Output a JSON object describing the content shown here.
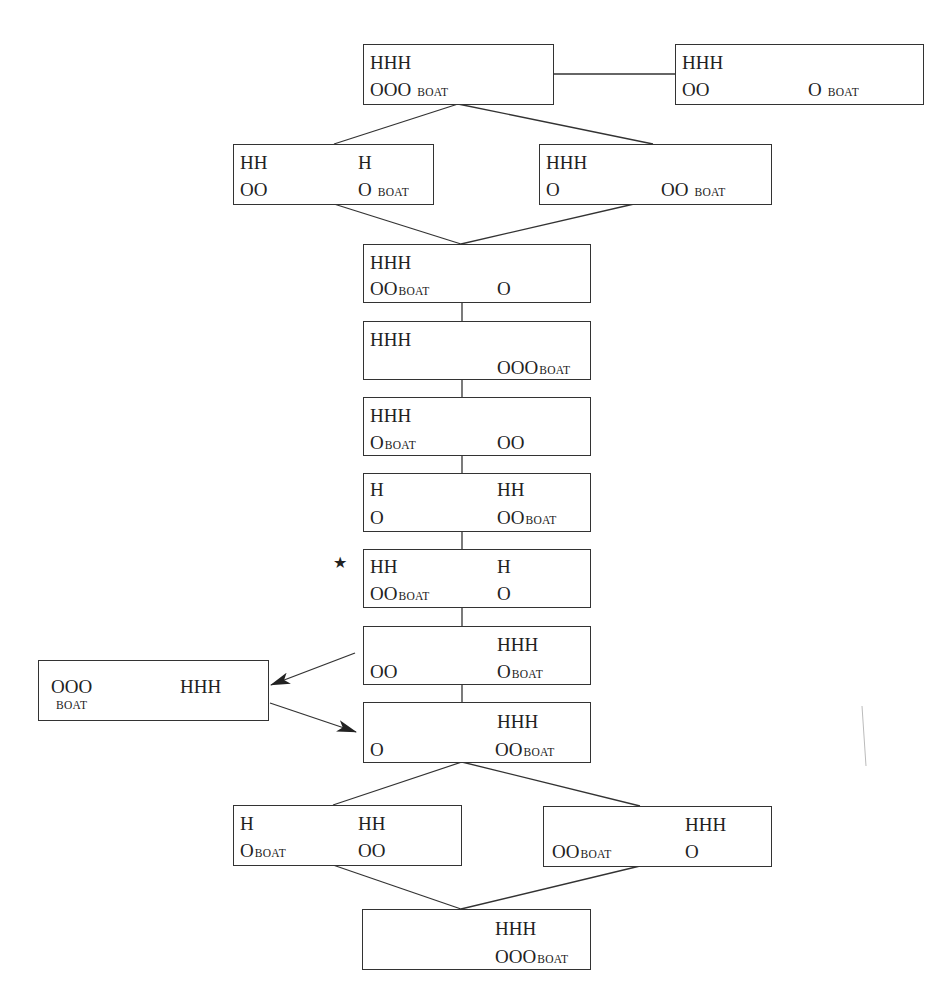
{
  "diagram": {
    "type": "state-space",
    "boat_label": "BOAT",
    "star_glyph": "★",
    "colors": {
      "line": "#333333",
      "text": "#222222",
      "background": "#ffffff"
    },
    "states": [
      {
        "id": "s0",
        "left_top": "HHH",
        "left_bottom": "OOO",
        "left_bottom_boat": "BOAT",
        "right_top": "",
        "right_bottom": "",
        "right_bottom_boat": ""
      },
      {
        "id": "s0b",
        "left_top": "HHH",
        "left_bottom": "OO",
        "left_bottom_boat": "",
        "right_top": "",
        "right_bottom": "O",
        "right_bottom_boat": "BOAT"
      },
      {
        "id": "s1a",
        "left_top": "HH",
        "left_bottom": "OO",
        "left_bottom_boat": "",
        "right_top": "H",
        "right_bottom": "O",
        "right_bottom_boat": "BOAT"
      },
      {
        "id": "s1b",
        "left_top": "HHH",
        "left_bottom": "O",
        "left_bottom_boat": "",
        "right_top": "",
        "right_bottom": "OO",
        "right_bottom_boat": "BOAT"
      },
      {
        "id": "s2",
        "left_top": "HHH",
        "left_bottom": "OO",
        "left_bottom_boat": "BOAT",
        "right_top": "",
        "right_bottom": "O",
        "right_bottom_boat": ""
      },
      {
        "id": "s3",
        "left_top": "HHH",
        "left_bottom": "",
        "left_bottom_boat": "",
        "right_top": "",
        "right_bottom": "OOO",
        "right_bottom_boat": "BOAT"
      },
      {
        "id": "s4",
        "left_top": "HHH",
        "left_bottom": "O",
        "left_bottom_boat": "BOAT",
        "right_top": "",
        "right_bottom": "OO",
        "right_bottom_boat": ""
      },
      {
        "id": "s5",
        "left_top": "H",
        "left_bottom": "O",
        "left_bottom_boat": "",
        "right_top": "HH",
        "right_bottom": "OO",
        "right_bottom_boat": "BOAT"
      },
      {
        "id": "s6",
        "left_top": "HH",
        "left_bottom": "OO",
        "left_bottom_boat": "BOAT",
        "right_top": "H",
        "right_bottom": "O",
        "right_bottom_boat": "",
        "starred": true
      },
      {
        "id": "s7",
        "left_top": "",
        "left_bottom": "OO",
        "left_bottom_boat": "",
        "right_top": "HHH",
        "right_bottom": "O",
        "right_bottom_boat": "BOAT"
      },
      {
        "id": "side",
        "left_top": "OOO",
        "left_bottom": "",
        "left_bottom_boat": "BOAT",
        "right_top": "HHH",
        "right_bottom": "",
        "right_bottom_boat": ""
      },
      {
        "id": "s8",
        "left_top": "",
        "left_bottom": "O",
        "left_bottom_boat": "",
        "right_top": "HHH",
        "right_bottom": "OO",
        "right_bottom_boat": "BOAT"
      },
      {
        "id": "s9a",
        "left_top": "H",
        "left_bottom": "O",
        "left_bottom_boat": "BOAT",
        "right_top": "HH",
        "right_bottom": "OO",
        "right_bottom_boat": ""
      },
      {
        "id": "s9b",
        "left_top": "",
        "left_bottom": "OO",
        "left_bottom_boat": "BOAT",
        "right_top": "HHH",
        "right_bottom": "O",
        "right_bottom_boat": ""
      },
      {
        "id": "s10",
        "left_top": "",
        "left_bottom": "",
        "left_bottom_boat": "",
        "right_top": "HHH",
        "right_bottom": "OOO",
        "right_bottom_boat": "BOAT"
      }
    ],
    "edges": [
      {
        "from": "s0",
        "to": "s0b",
        "style": "line"
      },
      {
        "from": "s0",
        "to": "s1a",
        "style": "line"
      },
      {
        "from": "s0",
        "to": "s1b",
        "style": "line"
      },
      {
        "from": "s1a",
        "to": "s2",
        "style": "line"
      },
      {
        "from": "s1b",
        "to": "s2",
        "style": "line"
      },
      {
        "from": "s2",
        "to": "s3",
        "style": "line"
      },
      {
        "from": "s3",
        "to": "s4",
        "style": "line"
      },
      {
        "from": "s4",
        "to": "s5",
        "style": "line"
      },
      {
        "from": "s5",
        "to": "s6",
        "style": "line"
      },
      {
        "from": "s6",
        "to": "s7",
        "style": "line"
      },
      {
        "from": "s7",
        "to": "side",
        "style": "arrow"
      },
      {
        "from": "side",
        "to": "s8",
        "style": "arrow"
      },
      {
        "from": "s7",
        "to": "s8",
        "style": "line"
      },
      {
        "from": "s8",
        "to": "s9a",
        "style": "line"
      },
      {
        "from": "s8",
        "to": "s9b",
        "style": "line"
      },
      {
        "from": "s9a",
        "to": "s10",
        "style": "line"
      },
      {
        "from": "s9b",
        "to": "s10",
        "style": "line"
      }
    ]
  }
}
